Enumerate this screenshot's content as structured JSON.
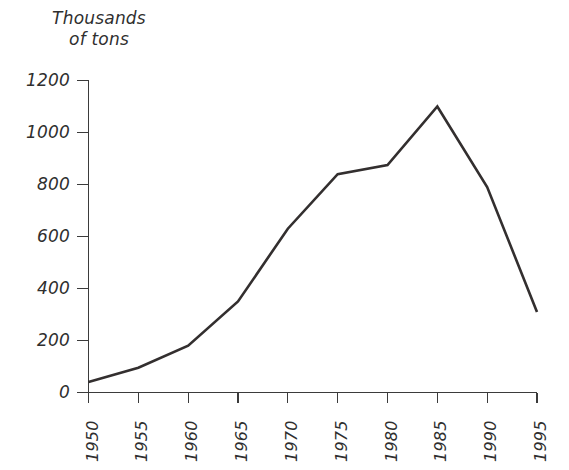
{
  "chart_data": {
    "type": "line",
    "title": "Thousands\nof tons",
    "title_line1": "Thousands",
    "title_line2": "of tons",
    "xlabel": "",
    "ylabel": "Thousands of tons",
    "categories": [
      "1950",
      "1955",
      "1960",
      "1965",
      "1970",
      "1975",
      "1980",
      "1985",
      "1990",
      "1995"
    ],
    "x": [
      1950,
      1955,
      1960,
      1965,
      1970,
      1975,
      1980,
      1985,
      1990,
      1995
    ],
    "values": [
      40,
      95,
      180,
      350,
      630,
      840,
      875,
      1100,
      790,
      310
    ],
    "series": [
      {
        "name": "Thousands of tons",
        "values": [
          40,
          95,
          180,
          350,
          630,
          840,
          875,
          1100,
          790,
          310
        ]
      }
    ],
    "ylim": [
      0,
      1200
    ],
    "xlim": [
      1950,
      1995
    ],
    "yticks": [
      0,
      200,
      400,
      600,
      800,
      1000,
      1200
    ],
    "ytick_labels": [
      "0",
      "200",
      "400",
      "600",
      "800",
      "1000",
      "1200"
    ],
    "xtick_labels": [
      "1950",
      "1955",
      "1960",
      "1965",
      "1970",
      "1975",
      "1980",
      "1985",
      "1990",
      "1995"
    ],
    "grid": false,
    "legend": false,
    "legend_position": "none",
    "xtick_label_rotation": -90,
    "annotations": [],
    "colors": {
      "background": "#ffffff",
      "line": "#332f2f",
      "axis": "#3b3b3b",
      "text": "#2f2f2f"
    }
  }
}
